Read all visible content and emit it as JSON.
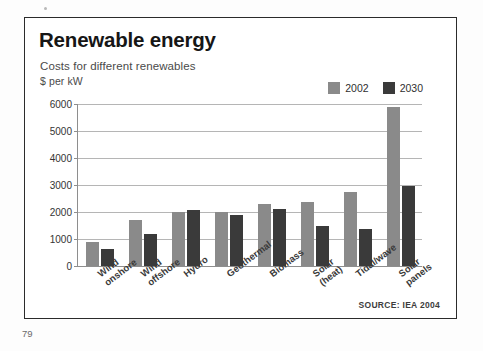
{
  "page": {
    "page_number": "79"
  },
  "chart": {
    "title": "Renewable energy",
    "subtitle": "Costs for different renewables",
    "unit_label": "$ per kW",
    "source": "SOURCE: IEA 2004",
    "colors": {
      "series_2002": "#8a8a8a",
      "series_2030": "#3a3a3a",
      "gridline": "#b5b5b5",
      "axis": "#8e8e8e",
      "frame": "#2b2b2b"
    }
  },
  "legend": {
    "items": [
      {
        "label": "2002",
        "color": "#8a8a8a"
      },
      {
        "label": "2030",
        "color": "#3a3a3a"
      }
    ]
  },
  "chart_data": {
    "type": "bar",
    "title": "Renewable energy",
    "subtitle": "Costs for different renewables",
    "xlabel": "",
    "ylabel": "$ per kW",
    "ylim": [
      0,
      6000
    ],
    "yticks": [
      0,
      1000,
      2000,
      3000,
      4000,
      5000,
      6000
    ],
    "ytick_labels": [
      "0",
      "1000",
      "2000",
      "3000",
      "4000",
      "5000",
      "6000"
    ],
    "grid": true,
    "legend_position": "top-right",
    "categories": [
      "Wind onshore",
      "Wind offshore",
      "Hydro",
      "Geothermal",
      "Biomass",
      "Solar (heat)",
      "Tidal/wave",
      "Solar panels"
    ],
    "category_lines": [
      [
        "Wind",
        "onshore"
      ],
      [
        "Wind",
        "offshore"
      ],
      [
        "Hydro"
      ],
      [
        "Geothermal"
      ],
      [
        "Biomass"
      ],
      [
        "Solar",
        "(heat)"
      ],
      [
        "Tidal/wave"
      ],
      [
        "Solar",
        "panels"
      ]
    ],
    "series": [
      {
        "name": "2002",
        "color": "#8a8a8a",
        "values": [
          900,
          1720,
          2000,
          2000,
          2280,
          2360,
          2750,
          5900
        ]
      },
      {
        "name": "2030",
        "color": "#3a3a3a",
        "values": [
          620,
          1200,
          2080,
          1900,
          2120,
          1500,
          1370,
          2950
        ]
      }
    ],
    "source": "SOURCE: IEA 2004"
  }
}
